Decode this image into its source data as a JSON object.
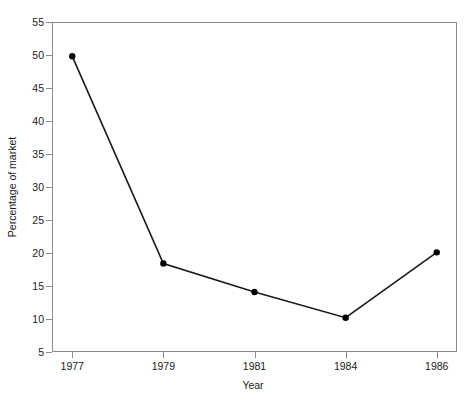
{
  "chart_data": {
    "type": "line",
    "title": "",
    "subtitle": "",
    "xlabel": "Year",
    "ylabel": "Percentage of market",
    "categories": [
      "1977",
      "1979",
      "1981",
      "1984",
      "1986"
    ],
    "values": [
      49.8,
      18.4,
      14.1,
      10.2,
      20.1
    ],
    "series": [
      {
        "name": "Percentage of market",
        "values": [
          49.8,
          18.4,
          14.1,
          10.2,
          20.1
        ]
      }
    ],
    "ylim": [
      5,
      55
    ],
    "yticks": [
      5,
      10,
      15,
      20,
      25,
      30,
      35,
      40,
      45,
      50,
      55
    ],
    "ytick_labels": [
      "5",
      "10",
      "15",
      "20",
      "25",
      "30",
      "35",
      "40",
      "45",
      "50",
      "55"
    ],
    "xtick_labels": [
      "1977",
      "1979",
      "1981",
      "1984",
      "1986"
    ],
    "grid": false,
    "legend": "none",
    "marker": "filled-circle",
    "line_color": "#1a1a1a",
    "marker_color": "#000000",
    "frame_color": "#8a8a8a",
    "background_color": "#ffffff"
  }
}
